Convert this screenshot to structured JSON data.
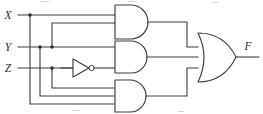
{
  "diagram": {
    "type": "logic-circuit-schematic",
    "background_color": "#ffffff",
    "line_color": "#3c3c3c",
    "label_color": "#2b2b2b"
  },
  "inputs": [
    {
      "id": "x",
      "label": "X",
      "y": 15
    },
    {
      "id": "y",
      "label": "Y",
      "y": 47
    },
    {
      "id": "z",
      "label": "Z",
      "y": 68
    }
  ],
  "output": {
    "id": "f",
    "label": "F"
  },
  "gates": [
    {
      "id": "and-top",
      "type": "AND",
      "label": "AND",
      "inputs": 2,
      "input_signals": [
        "X",
        "Y"
      ],
      "output_signal": "XY"
    },
    {
      "id": "and-middle",
      "type": "AND",
      "label": "AND",
      "inputs": 2,
      "input_signals": [
        "Y",
        "Z'"
      ],
      "output_signal": "YZ'"
    },
    {
      "id": "and-bottom",
      "type": "AND",
      "label": "AND",
      "inputs": 3,
      "input_signals": [
        "X",
        "Y",
        "Z"
      ],
      "output_signal": "XYZ"
    },
    {
      "id": "not-z",
      "type": "NOT",
      "label": "NOT",
      "inputs": 1,
      "input_signals": [
        "Z"
      ],
      "output_signal": "Z'"
    },
    {
      "id": "or-output",
      "type": "OR",
      "label": "OR",
      "inputs": 3,
      "input_signals": [
        "XY",
        "YZ'",
        "XYZ"
      ],
      "output_signal": "F"
    }
  ],
  "junctions": [
    {
      "on": "X",
      "x": 30,
      "y": 15
    },
    {
      "on": "Y",
      "x": 40,
      "y": 47
    },
    {
      "on": "Y",
      "x": 52,
      "y": 47
    },
    {
      "on": "Z",
      "x": 52,
      "y": 68
    }
  ]
}
